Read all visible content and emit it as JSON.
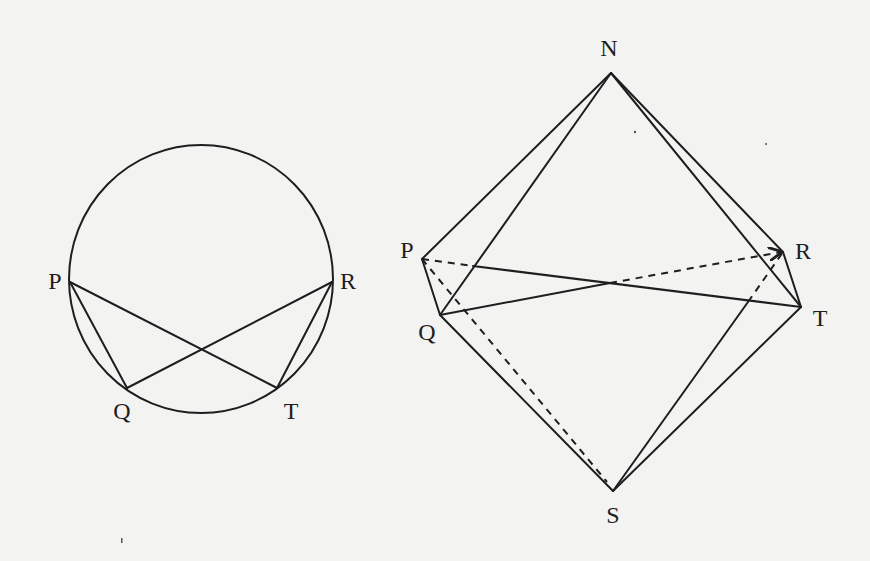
{
  "colors": {
    "paper": "#f3f3f2",
    "ink": "#1e1e1e"
  },
  "figures": [
    {
      "id": "circle-figure",
      "description": "Points P, Q, T, R on a circle with chords PQ, PT, QR, RT",
      "points": [
        "P",
        "Q",
        "T",
        "R"
      ],
      "chords": [
        [
          "P",
          "Q"
        ],
        [
          "P",
          "T"
        ],
        [
          "Q",
          "R"
        ],
        [
          "R",
          "T"
        ]
      ]
    },
    {
      "id": "solid-figure",
      "description": "Polyhedron with apexes N and S over the quadrilateral P, Q, T, R",
      "points": [
        "N",
        "P",
        "Q",
        "R",
        "T",
        "S"
      ],
      "solid_edges": [
        [
          "N",
          "P"
        ],
        [
          "N",
          "Q"
        ],
        [
          "N",
          "R"
        ],
        [
          "N",
          "T"
        ],
        [
          "P",
          "Q"
        ],
        [
          "R",
          "T"
        ],
        [
          "Q",
          "S"
        ],
        [
          "T",
          "S"
        ]
      ],
      "dashed_edges": [
        [
          "P",
          "S"
        ]
      ],
      "partly_hidden_edges": [
        {
          "edge": [
            "P",
            "T"
          ],
          "hidden_part": "near P"
        },
        {
          "edge": [
            "Q",
            "R"
          ],
          "hidden_part": "near R",
          "arrow_at": "R"
        },
        {
          "edge": [
            "S",
            "R"
          ],
          "hidden_part": "near R"
        }
      ]
    }
  ],
  "labels": {
    "circle": {
      "P": "P",
      "Q": "Q",
      "T": "T",
      "R": "R"
    },
    "solid": {
      "N": "N",
      "P": "P",
      "Q": "Q",
      "R": "R",
      "T": "T",
      "S": "S"
    }
  }
}
